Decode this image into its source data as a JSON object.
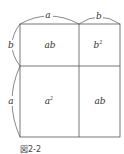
{
  "figure": {
    "caption": "図2-2",
    "side_labels": {
      "top_left": "a",
      "top_right": "b",
      "left_top": "b",
      "left_bottom": "a"
    },
    "cells": {
      "top_left": "ab",
      "top_right_base": "b",
      "top_right_exp": "2",
      "bottom_left_base": "a",
      "bottom_left_exp": "2",
      "bottom_right": "ab"
    },
    "colors": {
      "line": "#555555",
      "text": "#333333"
    }
  }
}
